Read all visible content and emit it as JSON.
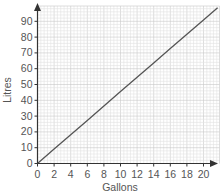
{
  "chart_data": {
    "type": "line",
    "title": "",
    "xlabel": "Gallons",
    "ylabel": "Litres",
    "xlim": [
      0,
      21.5
    ],
    "ylim": [
      0,
      98
    ],
    "x_ticks": [
      0,
      2,
      4,
      6,
      8,
      10,
      12,
      14,
      16,
      18,
      20
    ],
    "y_ticks": [
      0,
      10,
      20,
      30,
      40,
      50,
      60,
      70,
      80,
      90
    ],
    "grid": true,
    "minor_grid_per_major": 5,
    "legend": null,
    "series": [
      {
        "name": "Litres vs Gallons",
        "x": [
          0,
          2,
          4,
          6,
          8,
          10,
          12,
          14,
          16,
          18,
          20,
          21.7
        ],
        "y": [
          0,
          9.1,
          18.2,
          27.3,
          36.4,
          45.5,
          54.6,
          63.6,
          72.7,
          81.8,
          90.9,
          98.6
        ],
        "color": "#555555"
      }
    ]
  },
  "colors": {
    "axis": "#333333",
    "grid_minor": "#e2e2e2",
    "grid_major": "#c8c8c8",
    "line": "#555555",
    "text": "#555555"
  }
}
